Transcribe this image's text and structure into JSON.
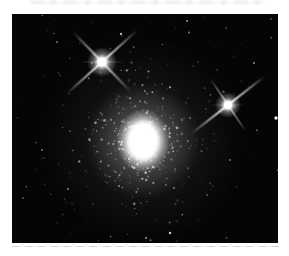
{
  "scene": {
    "description": "black-and-white astronomical photo of a globular star cluster with two bright foreground stars showing diffraction spikes",
    "canvas": {
      "width": 289,
      "height": 256,
      "background_color": "#ffffff"
    },
    "photo": {
      "x": 12,
      "y": 14,
      "width": 266,
      "height": 229,
      "background_color": "#050505",
      "star_color": "#ffffff"
    },
    "artifacts": {
      "top_smudge": {
        "x": 30,
        "y": 1,
        "width": 236,
        "height": 3,
        "color": "#ececec"
      },
      "bottom_line": {
        "x": 12,
        "y": 246,
        "width": 267,
        "height": 1,
        "color": "#cdcdcd"
      }
    },
    "cluster": {
      "cx": 131,
      "cy": 127,
      "core": {
        "rx": 15,
        "ry": 19
      },
      "core_glow": {
        "rx": 27,
        "ry": 32
      },
      "mid_glow_r": 58,
      "outer_halo_r": 100,
      "dense_stars": {
        "count": 430,
        "sigma": 40,
        "y_stretch": 1.12
      },
      "spread_stars": {
        "count": 160,
        "sigma": 72,
        "y_stretch": 1.15
      }
    },
    "bright_stars": [
      {
        "name": "upper-left-star",
        "cx": 90,
        "cy": 48,
        "core_r": 4.6,
        "glow_r": 15,
        "spikes": [
          {
            "angle": -42,
            "length": 96,
            "width": 2.6,
            "opacity": 0.8
          },
          {
            "angle": 46,
            "length": 84,
            "width": 2.4,
            "opacity": 0.72
          },
          {
            "angle": 0,
            "length": 46,
            "width": 1.6,
            "opacity": 0.28
          }
        ]
      },
      {
        "name": "right-star",
        "cx": 216,
        "cy": 91,
        "core_r": 4.0,
        "glow_r": 13,
        "spikes": [
          {
            "angle": -38,
            "length": 94,
            "width": 2.3,
            "opacity": 0.85
          },
          {
            "angle": 56,
            "length": 64,
            "width": 2.0,
            "opacity": 0.6
          },
          {
            "angle": 0,
            "length": 36,
            "width": 1.4,
            "opacity": 0.22
          }
        ]
      }
    ],
    "field_stars": {
      "count": 72,
      "min_r": 0.4,
      "max_r": 1.1
    },
    "notable_stars": [
      {
        "x": 264,
        "y": 104,
        "r": 1.7,
        "opacity": 0.95
      },
      {
        "x": 109,
        "y": 20,
        "r": 1.2,
        "opacity": 0.7
      },
      {
        "x": 175,
        "y": 7,
        "r": 1.0,
        "opacity": 0.6
      },
      {
        "x": 242,
        "y": 49,
        "r": 1.0,
        "opacity": 0.55
      },
      {
        "x": 30,
        "y": 136,
        "r": 0.9,
        "opacity": 0.5
      },
      {
        "x": 56,
        "y": 175,
        "r": 1.0,
        "opacity": 0.5
      },
      {
        "x": 158,
        "y": 219,
        "r": 1.2,
        "opacity": 0.8
      },
      {
        "x": 134,
        "y": 224,
        "r": 1.0,
        "opacity": 0.6
      },
      {
        "x": 45,
        "y": 28,
        "r": 0.9,
        "opacity": 0.5
      },
      {
        "x": 218,
        "y": 146,
        "r": 0.9,
        "opacity": 0.5
      }
    ],
    "seed": 1337
  }
}
